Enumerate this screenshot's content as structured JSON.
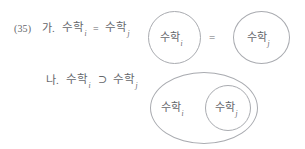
{
  "document": {
    "example_number": "(35)",
    "language": "ko",
    "background_color": "#ffffff",
    "ink_color": "#64666b",
    "stroke_color": "#a9abb0"
  },
  "items": [
    {
      "label": "가.",
      "formula": {
        "left": {
          "base": "수학",
          "subscript": "i"
        },
        "operator": "=",
        "right": {
          "base": "수학",
          "subscript": "j"
        }
      }
    },
    {
      "label": "나.",
      "formula": {
        "left": {
          "base": "수학",
          "subscript": "i"
        },
        "operator": "⊃",
        "right": {
          "base": "수학",
          "subscript": "j"
        }
      }
    }
  ],
  "diagrams": [
    {
      "id": "equality-diagram",
      "type": "two-disjoint-circles",
      "relation_symbol": "=",
      "sets": [
        {
          "base": "수학",
          "subscript": "i"
        },
        {
          "base": "수학",
          "subscript": "j"
        }
      ]
    },
    {
      "id": "subset-diagram",
      "type": "nested-ellipse",
      "sets": [
        {
          "base": "수학",
          "subscript": "i",
          "role": "outer"
        },
        {
          "base": "수학",
          "subscript": "j",
          "role": "inner"
        }
      ]
    }
  ]
}
